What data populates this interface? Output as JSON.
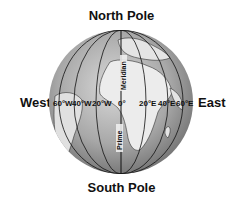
{
  "labels": {
    "north": "North Pole",
    "south": "South Pole",
    "west": "West",
    "east": "East",
    "meridian_upper": "Meridian",
    "meridian_lower": "Prime"
  },
  "longitudes": [
    "60°W",
    "40°W",
    "20°W",
    "0°",
    "20°E",
    "40°E",
    "60°E"
  ],
  "colors": {
    "ocean": "#9a9a9a",
    "land": "#e6e6e6",
    "lines": "#111111"
  }
}
